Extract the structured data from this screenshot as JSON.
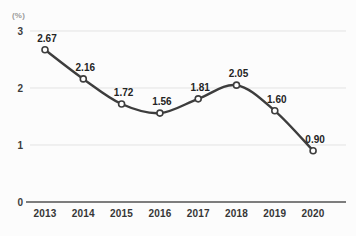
{
  "chart_data": {
    "type": "line",
    "unit_label": "(%)",
    "categories": [
      "2013",
      "2014",
      "2015",
      "2016",
      "2017",
      "2018",
      "2019",
      "2020"
    ],
    "values": [
      2.67,
      2.16,
      1.72,
      1.56,
      1.81,
      2.05,
      1.6,
      0.9
    ],
    "data_labels": [
      "2.67",
      "2.16",
      "1.72",
      "1.56",
      "1.81",
      "2.05",
      "1.60",
      "0.90"
    ],
    "title": "",
    "xlabel": "",
    "ylabel": "(%)",
    "ylim": [
      0,
      3
    ],
    "yticks": [
      0,
      1,
      2,
      3
    ],
    "grid": true,
    "legend": "none",
    "style": {
      "line_color": "#3d3d3d",
      "marker": "open-circle",
      "marker_fill": "#ffffff",
      "gridline_color": "#e3e3e3",
      "axis_color": "#7d7d7d",
      "label_color": "#242424",
      "tick_color": "#3c3c3c",
      "background": "#fcfcfc"
    }
  }
}
